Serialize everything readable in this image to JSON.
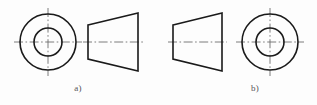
{
  "sheet": {
    "background": "#fdfdfd",
    "line_color": "#1a1a1a",
    "centerline_color": "#6e6e6e",
    "caption_color": "#555458"
  },
  "figures": [
    {
      "id": "figure-a",
      "label": "a)",
      "label_x": 78,
      "label_y": 90,
      "views": [
        {
          "name": "front-view-concentric-circles",
          "type": "circles",
          "cx": 48,
          "cy": 42,
          "outer_radius": 28,
          "inner_radius": 14,
          "centerline_extend": 6
        },
        {
          "name": "side-view-truncated-cone",
          "type": "trapezoid",
          "left_x": 88,
          "right_x": 138,
          "left_half_height": 17,
          "right_half_height": 29,
          "axis_y": 42,
          "axis_extend": 5
        }
      ]
    },
    {
      "id": "figure-b",
      "label": "b)",
      "label_x": 255,
      "label_y": 90,
      "views": [
        {
          "name": "side-view-truncated-cone",
          "type": "trapezoid",
          "left_x": 173,
          "right_x": 222,
          "left_half_height": 17,
          "right_half_height": 29,
          "axis_y": 42,
          "axis_extend": 5
        },
        {
          "name": "front-view-concentric-circles",
          "type": "circles",
          "cx": 270,
          "cy": 42,
          "outer_radius": 28,
          "inner_radius": 14,
          "centerline_extend": 6
        }
      ]
    }
  ],
  "captions": {
    "a": "a)",
    "b": "b)"
  },
  "style": {
    "outline_width": 1.6,
    "centerline_width": 0.9,
    "centerline_dash": "9 2.5 1.6 2.5"
  }
}
